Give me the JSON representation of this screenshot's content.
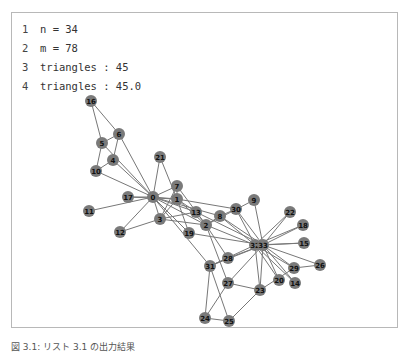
{
  "code_output": {
    "lines": [
      {
        "num": "1",
        "text": "n = 34"
      },
      {
        "num": "2",
        "text": "m = 78"
      },
      {
        "num": "3",
        "text": "triangles : 45"
      },
      {
        "num": "4",
        "text": "triangles : 45.0"
      }
    ]
  },
  "graph": {
    "node_color": "#7a7a7a",
    "edge_color": "#777777",
    "label_color": "#111111",
    "nodes": [
      {
        "id": "0",
        "x": 153,
        "y": 197
      },
      {
        "id": "1",
        "x": 177,
        "y": 199
      },
      {
        "id": "2",
        "x": 206,
        "y": 225
      },
      {
        "id": "3",
        "x": 160,
        "y": 219
      },
      {
        "id": "4",
        "x": 113,
        "y": 160
      },
      {
        "id": "5",
        "x": 102,
        "y": 143
      },
      {
        "id": "6",
        "x": 119,
        "y": 134
      },
      {
        "id": "7",
        "x": 177,
        "y": 186
      },
      {
        "id": "8",
        "x": 220,
        "y": 216
      },
      {
        "id": "9",
        "x": 254,
        "y": 200
      },
      {
        "id": "10",
        "x": 96,
        "y": 171
      },
      {
        "id": "11",
        "x": 89,
        "y": 211
      },
      {
        "id": "12",
        "x": 120,
        "y": 232
      },
      {
        "id": "13",
        "x": 196,
        "y": 212
      },
      {
        "id": "14",
        "x": 295,
        "y": 283
      },
      {
        "id": "15",
        "x": 304,
        "y": 243
      },
      {
        "id": "16",
        "x": 91,
        "y": 101
      },
      {
        "id": "17",
        "x": 128,
        "y": 197
      },
      {
        "id": "18",
        "x": 303,
        "y": 225
      },
      {
        "id": "19",
        "x": 189,
        "y": 233
      },
      {
        "id": "20",
        "x": 279,
        "y": 280
      },
      {
        "id": "21",
        "x": 160,
        "y": 157
      },
      {
        "id": "22",
        "x": 290,
        "y": 212
      },
      {
        "id": "23",
        "x": 260,
        "y": 290
      },
      {
        "id": "24",
        "x": 205,
        "y": 318
      },
      {
        "id": "25",
        "x": 229,
        "y": 321
      },
      {
        "id": "26",
        "x": 320,
        "y": 265
      },
      {
        "id": "27",
        "x": 228,
        "y": 283
      },
      {
        "id": "28",
        "x": 228,
        "y": 258
      },
      {
        "id": "29",
        "x": 294,
        "y": 268
      },
      {
        "id": "30",
        "x": 236,
        "y": 209
      },
      {
        "id": "31",
        "x": 210,
        "y": 266
      },
      {
        "id": "32",
        "x": 255,
        "y": 245
      },
      {
        "id": "33",
        "x": 263,
        "y": 245
      }
    ],
    "edges": [
      [
        0,
        1
      ],
      [
        0,
        2
      ],
      [
        0,
        3
      ],
      [
        0,
        4
      ],
      [
        0,
        5
      ],
      [
        0,
        6
      ],
      [
        0,
        7
      ],
      [
        0,
        8
      ],
      [
        0,
        10
      ],
      [
        0,
        11
      ],
      [
        0,
        12
      ],
      [
        0,
        13
      ],
      [
        0,
        17
      ],
      [
        0,
        19
      ],
      [
        0,
        21
      ],
      [
        0,
        31
      ],
      [
        1,
        2
      ],
      [
        1,
        3
      ],
      [
        1,
        7
      ],
      [
        1,
        13
      ],
      [
        1,
        17
      ],
      [
        1,
        19
      ],
      [
        1,
        21
      ],
      [
        1,
        30
      ],
      [
        2,
        3
      ],
      [
        2,
        7
      ],
      [
        2,
        8
      ],
      [
        2,
        9
      ],
      [
        2,
        13
      ],
      [
        2,
        27
      ],
      [
        2,
        28
      ],
      [
        2,
        32
      ],
      [
        3,
        7
      ],
      [
        3,
        12
      ],
      [
        3,
        13
      ],
      [
        4,
        6
      ],
      [
        4,
        10
      ],
      [
        5,
        6
      ],
      [
        5,
        10
      ],
      [
        5,
        16
      ],
      [
        6,
        16
      ],
      [
        8,
        30
      ],
      [
        8,
        32
      ],
      [
        8,
        33
      ],
      [
        9,
        33
      ],
      [
        13,
        33
      ],
      [
        14,
        32
      ],
      [
        14,
        33
      ],
      [
        15,
        32
      ],
      [
        15,
        33
      ],
      [
        18,
        32
      ],
      [
        18,
        33
      ],
      [
        19,
        33
      ],
      [
        20,
        32
      ],
      [
        20,
        33
      ],
      [
        22,
        32
      ],
      [
        22,
        33
      ],
      [
        23,
        25
      ],
      [
        23,
        27
      ],
      [
        23,
        29
      ],
      [
        23,
        32
      ],
      [
        23,
        33
      ],
      [
        24,
        25
      ],
      [
        24,
        27
      ],
      [
        24,
        31
      ],
      [
        25,
        31
      ],
      [
        26,
        29
      ],
      [
        26,
        33
      ],
      [
        27,
        33
      ],
      [
        28,
        31
      ],
      [
        28,
        33
      ],
      [
        29,
        32
      ],
      [
        29,
        33
      ],
      [
        30,
        32
      ],
      [
        30,
        33
      ],
      [
        31,
        32
      ],
      [
        31,
        33
      ],
      [
        32,
        33
      ]
    ]
  },
  "caption": {
    "text": "図 3.1: リスト 3.1 の出力結果"
  }
}
